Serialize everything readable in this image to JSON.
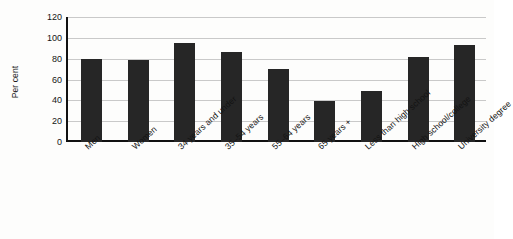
{
  "chart_data": {
    "type": "bar",
    "title": "",
    "xlabel": "",
    "ylabel": "Per cent",
    "ylim": [
      0,
      120
    ],
    "yticks": [
      0,
      20,
      40,
      60,
      80,
      100,
      120
    ],
    "ytick_labels": [
      "0",
      "20",
      "40",
      "60",
      "80",
      "100",
      "120"
    ],
    "grid": true,
    "legend": "none",
    "bar_color": "#262626",
    "categories": [
      "Men",
      "Women",
      "34 years and under",
      "35–54 years",
      "55–64 years",
      "65 years +",
      "Less than high school",
      "High school/college",
      "University degree"
    ],
    "values": [
      80,
      79,
      95,
      86,
      70,
      39,
      49,
      82,
      93
    ]
  }
}
